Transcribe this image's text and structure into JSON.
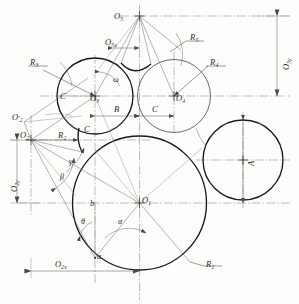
{
  "figure": {
    "type": "engineering-geometric-construction",
    "title": ""
  },
  "centers": [
    {
      "id": "O1",
      "base": "O",
      "sub": "1",
      "label": "O1",
      "cx": 139.5,
      "cy": 203.0
    },
    {
      "id": "O2",
      "base": "O",
      "sub": "2",
      "label": "O2",
      "cx": 31.0,
      "cy": 140.0
    },
    {
      "id": "O2p",
      "base": "O",
      "sub": "2",
      "label": "O2'",
      "cx": 24.0,
      "cy": 122.0
    },
    {
      "id": "O3",
      "base": "O",
      "sub": "3",
      "label": "O3",
      "cx": 95.0,
      "cy": 96.0
    },
    {
      "id": "O4",
      "base": "O",
      "sub": "4",
      "label": "O4",
      "cx": 174.0,
      "cy": 96.0
    },
    {
      "id": "O5",
      "base": "O",
      "sub": "5",
      "label": "O5",
      "cx": 130.0,
      "cy": 16.0
    }
  ],
  "radii_labels": [
    {
      "id": "R1",
      "base": "R",
      "sub": "1",
      "x": 226,
      "y": 268
    },
    {
      "id": "R2",
      "base": "R",
      "sub": "2",
      "x": 63,
      "y": 135
    },
    {
      "id": "R3",
      "base": "R",
      "sub": "3",
      "x": 32,
      "y": 61
    },
    {
      "id": "R4",
      "base": "R",
      "sub": "4",
      "x": 213,
      "y": 62
    },
    {
      "id": "R5",
      "base": "R",
      "sub": "5",
      "x": 192,
      "y": 36
    }
  ],
  "dimensions": [
    {
      "id": "B",
      "label": "B",
      "x": 117,
      "y": 110,
      "orient": "horizontal"
    },
    {
      "id": "C1",
      "label": "C",
      "x": 156,
      "y": 110,
      "orient": "horizontal"
    },
    {
      "id": "C2",
      "label": "C",
      "x": 63,
      "y": 95,
      "orient": "horizontal"
    },
    {
      "id": "C3",
      "label": "C",
      "x": 87,
      "y": 128,
      "orient": "horizontal"
    },
    {
      "id": "A",
      "label": "A",
      "x": 248,
      "y": 160,
      "orient": "vertical"
    },
    {
      "id": "O5y",
      "base": "O",
      "sub": "5y",
      "label": "O5y",
      "x": 283,
      "y": 62,
      "orient": "vertical"
    },
    {
      "id": "O2y",
      "base": "O",
      "sub": "2y",
      "label": "O2y",
      "x": 11,
      "y": 185,
      "orient": "vertical"
    },
    {
      "id": "O2x",
      "base": "O",
      "sub": "2x",
      "label": "O2x",
      "x": 62,
      "y": 265,
      "orient": "horizontal"
    },
    {
      "id": "O5x",
      "base": "O",
      "sub": "5x",
      "label": "O5x",
      "x": 108,
      "y": 42,
      "orient": "horizontal"
    }
  ],
  "angles": [
    {
      "id": "alpha",
      "glyph": "α",
      "x": 121,
      "y": 222
    },
    {
      "id": "beta",
      "glyph": "β",
      "x": 62,
      "y": 177
    },
    {
      "id": "gamma",
      "glyph": "γ",
      "x": 71,
      "y": 162
    },
    {
      "id": "theta",
      "glyph": "θ",
      "x": 84,
      "y": 222
    },
    {
      "id": "omega",
      "glyph": "ω",
      "x": 115,
      "y": 80
    }
  ],
  "points": [
    {
      "id": "a",
      "label": "a",
      "x": 97,
      "y": 258
    },
    {
      "id": "b",
      "label": "b",
      "x": 92,
      "y": 205
    }
  ],
  "circles": [
    {
      "id": "circle-R1",
      "center": "O1",
      "cx": 139.5,
      "cy": 203.0,
      "r": 67.0,
      "weight": "thick"
    },
    {
      "id": "circle-R3",
      "center": "O3",
      "cx": 95.0,
      "cy": 96.0,
      "r": 38.0,
      "weight": "thick"
    },
    {
      "id": "circle-R4",
      "center": "O4",
      "cx": 174.0,
      "cy": 96.0,
      "r": 36.5,
      "weight": "med"
    },
    {
      "id": "circle-A",
      "center": "OA",
      "cx": 243.0,
      "cy": 160.0,
      "r": 40.0,
      "weight": "thick"
    }
  ],
  "colors": {
    "line_heavy": "#1a1a1a",
    "line_medium": "#3a3a3a",
    "line_thin": "#6a6a6a",
    "center_line": "#7c7c7c",
    "background": "#fdfdfc",
    "text": "#2b2b2b"
  }
}
